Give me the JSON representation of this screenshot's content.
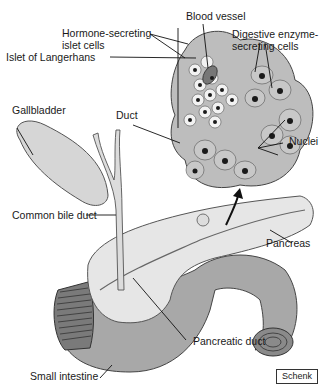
{
  "diagram": {
    "labels": {
      "blood_vessel": "Blood vessel",
      "hormone_secreting_line1": "Hormone-secreting",
      "hormone_secreting_line2": "islet cells",
      "digestive_line1": "Digestive enzyme-",
      "digestive_line2": "secreting cells",
      "islet_of_langerhans": "Islet of Langerhans",
      "gallbladder": "Gallbladder",
      "duct": "Duct",
      "nuclei": "Nuclei",
      "common_bile_duct": "Common bile duct",
      "pancreas": "Pancreas",
      "pancreatic_duct": "Pancreatic duct",
      "small_intestine": "Small intestine"
    },
    "credit": "Schenk",
    "colors": {
      "tissue_gray": "#b8b8b8",
      "organ_light": "#e4e4e4",
      "intestine_gray": "#a6a6a6",
      "nucleus": "#1a1a1a",
      "line": "#222222"
    }
  }
}
